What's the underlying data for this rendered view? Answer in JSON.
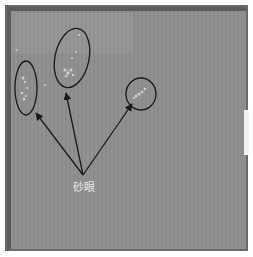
{
  "figure": {
    "type": "photograph with annotations",
    "annotation_label": "砂眼",
    "annotations": [
      {
        "name": "defect-region-left",
        "shape": "ellipse"
      },
      {
        "name": "defect-region-middle",
        "shape": "ellipse"
      },
      {
        "name": "defect-region-right",
        "shape": "circle"
      }
    ],
    "colors": {
      "surface": "#8e8e8e",
      "outline": "#1a1a1a",
      "label": "#e8e8e8",
      "defect_spots": "#d8d8d8"
    }
  }
}
